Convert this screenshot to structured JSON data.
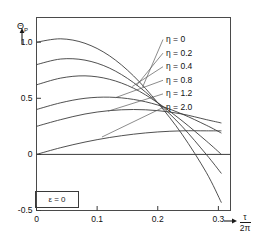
{
  "chart_data": {
    "type": "line",
    "title": "",
    "ylabel": "Θ_P",
    "ylabel_base": "Θ",
    "ylabel_sub": "P",
    "xlabel": "τ / 2π",
    "xlabel_numerator": "τ",
    "xlabel_denominator": "2π",
    "xlim": [
      0,
      0.32
    ],
    "ylim": [
      -0.5,
      1.22
    ],
    "xticks": [
      0,
      0.1,
      0.2,
      0.3
    ],
    "xticklabels": [
      "0",
      "0.1",
      "0.2",
      "0.3"
    ],
    "yticks": [
      -0.5,
      0,
      0.5,
      1.0
    ],
    "yticklabels": [
      "-0.5",
      "0",
      "0.5",
      "1.0"
    ],
    "grid": false,
    "legend_position": "upper-right-inside",
    "annotation": "ε = 0",
    "line_color": "#3c3c3c",
    "frame_color": "#4a4a4a",
    "background": "#ffffff",
    "series": [
      {
        "name": "η = 0",
        "eta": 0,
        "label": "η = 0",
        "x": [
          0,
          0.04,
          0.08,
          0.12,
          0.16,
          0.2,
          0.24,
          0.28,
          0.305
        ],
        "y": [
          1.0,
          1.03,
          0.99,
          0.88,
          0.7,
          0.46,
          0.18,
          -0.16,
          -0.43
        ]
      },
      {
        "name": "η = 0.2",
        "eta": 0.2,
        "label": "η = 0.2",
        "x": [
          0,
          0.04,
          0.08,
          0.12,
          0.16,
          0.2,
          0.24,
          0.28,
          0.305
        ],
        "y": [
          0.8,
          0.85,
          0.84,
          0.77,
          0.64,
          0.46,
          0.25,
          0.0,
          -0.17
        ]
      },
      {
        "name": "η = 0.4",
        "eta": 0.4,
        "label": "η = 0.4",
        "x": [
          0,
          0.04,
          0.08,
          0.12,
          0.16,
          0.2,
          0.24,
          0.28,
          0.305
        ],
        "y": [
          0.62,
          0.68,
          0.7,
          0.67,
          0.59,
          0.46,
          0.3,
          0.12,
          0.0
        ]
      },
      {
        "name": "η = 0.8",
        "eta": 0.8,
        "label": "η = 0.8",
        "x": [
          0,
          0.04,
          0.08,
          0.12,
          0.16,
          0.2,
          0.24,
          0.28,
          0.305
        ],
        "y": [
          0.4,
          0.46,
          0.5,
          0.51,
          0.49,
          0.44,
          0.36,
          0.26,
          0.19
        ]
      },
      {
        "name": "η = 1.2",
        "eta": 1.2,
        "label": "η = 1.2",
        "x": [
          0,
          0.04,
          0.08,
          0.12,
          0.16,
          0.2,
          0.24,
          0.28,
          0.305
        ],
        "y": [
          0.25,
          0.31,
          0.36,
          0.39,
          0.4,
          0.39,
          0.36,
          0.31,
          0.28
        ]
      },
      {
        "name": "η = 2.0",
        "eta": 2.0,
        "label": "η = 2.0",
        "x": [
          0,
          0.04,
          0.08,
          0.12,
          0.16,
          0.2,
          0.24,
          0.28,
          0.305
        ],
        "y": [
          0.0,
          0.06,
          0.11,
          0.15,
          0.18,
          0.2,
          0.21,
          0.21,
          0.21
        ]
      }
    ]
  },
  "axes": {
    "y_label_main": "Θ",
    "y_label_sub": "P",
    "y_ticks": [
      "1.0",
      "0.5",
      "0",
      "-0.5"
    ],
    "x_ticks": [
      "0",
      "0.1",
      "0.2",
      "0.3"
    ],
    "x_label_num": "τ",
    "x_label_den": "2π"
  },
  "legend": {
    "entries": [
      {
        "label": "η = 0"
      },
      {
        "label": "η = 0.2"
      },
      {
        "label": "η = 0.4"
      },
      {
        "label": "η = 0.8"
      },
      {
        "label": "η = 1.2"
      },
      {
        "label": "η = 2.0"
      }
    ]
  },
  "annotation": {
    "epsilon": "ε = 0"
  }
}
